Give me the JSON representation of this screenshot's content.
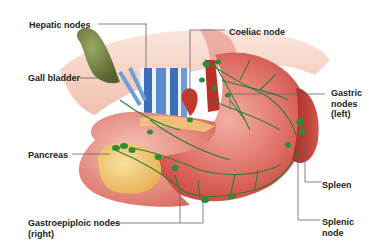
{
  "figure": {
    "labels": {
      "hepatic_nodes": "Hepatic nodes",
      "gall_bladder": "Gall bladder",
      "coeliac_node": "Coeliac node",
      "gastric_nodes_left": "Gastric\nnodes\n(left)",
      "pancreas": "Pancreas",
      "spleen": "Spleen",
      "gastroepiploic_nodes_right": "Gastroepiploic nodes\n(right)",
      "splenic_node": "Splenic\nnode"
    },
    "colors": {
      "stomach": "#d9605a",
      "stomach_light": "#f0a59a",
      "pancreas": "#f2c46a",
      "gall_bladder": "#6b7a3a",
      "spleen": "#b8342e",
      "lymph": "#2f8a3a",
      "vein": "#3b6fb8",
      "leader": "#555555"
    }
  }
}
